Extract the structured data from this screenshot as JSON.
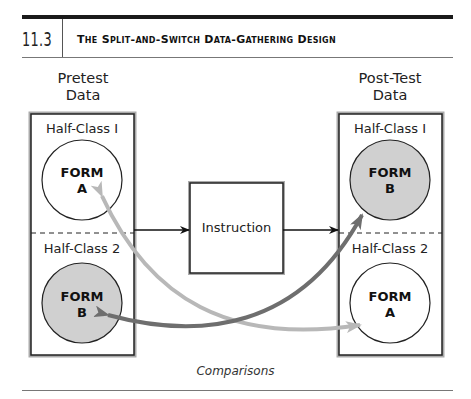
{
  "header": {
    "chapter_number": "11.3",
    "title": "The Split-and-Switch Data-Gathering Design"
  },
  "diagram": {
    "pretest": {
      "label_line1": "Pretest",
      "label_line2": "Data",
      "half_class_1": {
        "label": "Half-Class I",
        "form_line1": "FORM",
        "form_line2": "A",
        "fill": "#ffffff"
      },
      "half_class_2": {
        "label": "Half-Class 2",
        "form_line1": "FORM",
        "form_line2": "B",
        "fill": "#d0d0d0"
      }
    },
    "instruction": {
      "label": "Instruction"
    },
    "posttest": {
      "label_line1": "Post-Test",
      "label_line2": "Data",
      "half_class_1": {
        "label": "Half-Class I",
        "form_line1": "FORM",
        "form_line2": "B",
        "fill": "#d0d0d0"
      },
      "half_class_2": {
        "label": "Half-Class 2",
        "form_line1": "FORM",
        "form_line2": "A",
        "fill": "#ffffff"
      }
    },
    "comparison_arrows": {
      "form_a_color": "#b8b8b8",
      "form_b_color": "#6e6e6e"
    },
    "caption": "Comparisons"
  }
}
